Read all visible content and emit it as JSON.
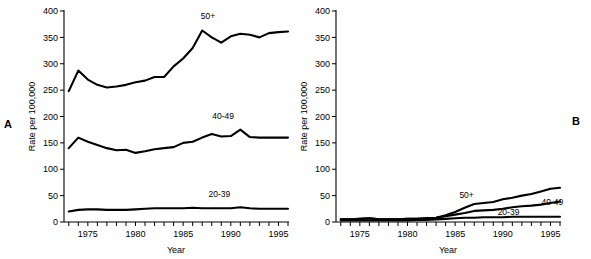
{
  "figure": {
    "panel_a_label": "A",
    "panel_b_label": "B"
  },
  "chart_data": [
    {
      "id": "panel-a",
      "type": "line",
      "title": "",
      "panel": "A",
      "xlabel": "Year",
      "ylabel": "Rate per 100,000",
      "xlim": [
        1972.5,
        1996.0
      ],
      "ylim": [
        0,
        400
      ],
      "yticks": [
        0,
        50,
        100,
        150,
        200,
        250,
        300,
        350,
        400
      ],
      "xticks": [
        1973,
        1974,
        1975,
        1976,
        1977,
        1978,
        1979,
        1980,
        1981,
        1982,
        1983,
        1984,
        1985,
        1986,
        1987,
        1988,
        1989,
        1990,
        1991,
        1992,
        1993,
        1994,
        1995,
        1996
      ],
      "xtick_labels": [
        {
          "value": 1975,
          "label": "1975"
        },
        {
          "value": 1980,
          "label": "1980"
        },
        {
          "value": 1985,
          "label": "1985"
        },
        {
          "value": 1990,
          "label": "1990"
        },
        {
          "value": 1995,
          "label": "1995"
        }
      ],
      "grid": false,
      "legend": "inline-annotations",
      "x": [
        1973,
        1974,
        1975,
        1976,
        1977,
        1978,
        1979,
        1980,
        1981,
        1982,
        1983,
        1984,
        1985,
        1986,
        1987,
        1988,
        1989,
        1990,
        1991,
        1992,
        1993,
        1994,
        1995,
        1996
      ],
      "series": [
        {
          "name": "50+",
          "label": "50+",
          "label_x": 1987.6,
          "label_y": 385,
          "values": [
            248,
            287,
            270,
            260,
            255,
            257,
            260,
            265,
            268,
            275,
            275,
            295,
            310,
            330,
            363,
            350,
            340,
            352,
            357,
            355,
            350,
            358,
            360,
            361
          ]
        },
        {
          "name": "40-49",
          "label": "40-49",
          "label_x": 1989.2,
          "label_y": 196,
          "values": [
            140,
            160,
            152,
            146,
            140,
            136,
            137,
            131,
            134,
            138,
            140,
            142,
            150,
            152,
            160,
            167,
            162,
            163,
            175,
            161,
            160,
            160,
            160,
            160
          ]
        },
        {
          "name": "20-39",
          "label": "20-39",
          "label_x": 1988.8,
          "label_y": 47,
          "values": [
            20,
            23,
            24,
            24,
            23,
            23,
            23,
            24,
            25,
            26,
            26,
            26,
            26,
            27,
            26,
            26,
            26,
            26,
            28,
            26,
            25,
            25,
            25,
            25
          ]
        }
      ]
    },
    {
      "id": "panel-b",
      "type": "line",
      "title": "",
      "panel": "B",
      "xlabel": "Year",
      "ylabel": "Rate per 100,000",
      "xlim": [
        1972.5,
        1996.0
      ],
      "ylim": [
        0,
        400
      ],
      "yticks": [
        0,
        50,
        100,
        150,
        200,
        250,
        300,
        350,
        400
      ],
      "xticks": [
        1973,
        1974,
        1975,
        1976,
        1977,
        1978,
        1979,
        1980,
        1981,
        1982,
        1983,
        1984,
        1985,
        1986,
        1987,
        1988,
        1989,
        1990,
        1991,
        1992,
        1993,
        1994,
        1995,
        1996
      ],
      "xtick_labels": [
        {
          "value": 1975,
          "label": "1975"
        },
        {
          "value": 1980,
          "label": "1980"
        },
        {
          "value": 1985,
          "label": "1985"
        },
        {
          "value": 1990,
          "label": "1990"
        },
        {
          "value": 1995,
          "label": "1995"
        }
      ],
      "grid": false,
      "legend": "inline-annotations",
      "x": [
        1973,
        1974,
        1975,
        1976,
        1977,
        1978,
        1979,
        1980,
        1981,
        1982,
        1983,
        1984,
        1985,
        1986,
        1987,
        1988,
        1989,
        1990,
        1991,
        1992,
        1993,
        1994,
        1995,
        1996
      ],
      "series": [
        {
          "name": "50+",
          "label": "50+",
          "label_x": 1986.2,
          "label_y": 46,
          "values": [
            5,
            5,
            6,
            7,
            5,
            5,
            5,
            6,
            6,
            7,
            8,
            13,
            19,
            27,
            34,
            36,
            38,
            43,
            46,
            50,
            53,
            58,
            63,
            65
          ]
        },
        {
          "name": "40-49",
          "label": "40-49",
          "label_x": 1995.2,
          "label_y": 33,
          "values": [
            5,
            5,
            6,
            7,
            5,
            5,
            5,
            6,
            6,
            7,
            8,
            11,
            14,
            17,
            21,
            22,
            23,
            25,
            28,
            30,
            31,
            33,
            36,
            39
          ]
        },
        {
          "name": "20-39",
          "label": "20-39",
          "label_x": 1990.6,
          "label_y": 14,
          "values": [
            3,
            3,
            3,
            3,
            3,
            3,
            3,
            3,
            4,
            4,
            5,
            6,
            7,
            8,
            8,
            9,
            9,
            9,
            10,
            10,
            10,
            10,
            10,
            10
          ]
        }
      ]
    }
  ]
}
